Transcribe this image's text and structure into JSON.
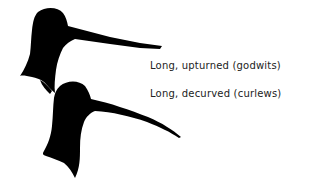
{
  "diagram": {
    "type": "bird-bill-shapes",
    "items": [
      {
        "id": "godwit",
        "label": "Long, upturned (godwits)",
        "silhouette": "godwit-head-silhouette"
      },
      {
        "id": "curlew",
        "label": "Long, decurved (curlews)",
        "silhouette": "curlew-head-silhouette"
      }
    ],
    "colors": {
      "silhouette": "#000000",
      "text": "#222222",
      "background": "#ffffff"
    }
  }
}
